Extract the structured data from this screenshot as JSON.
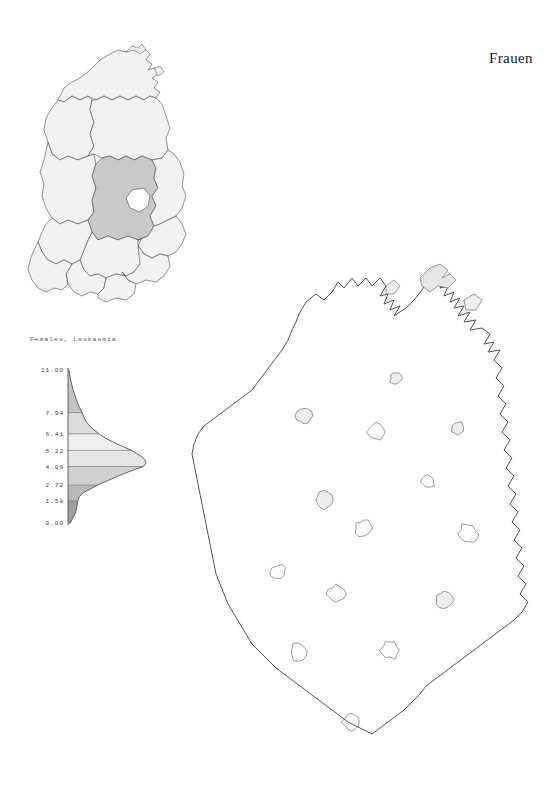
{
  "figure": {
    "title": "Frauen",
    "background_color": "#ffffff"
  },
  "inset_map": {
    "name": "gdr-bezirke-overview",
    "description": "Uebersichtskarte der Bezirke",
    "highlighted_region_shade": "#c9c9c9",
    "base_shade": "#f2f2f2",
    "outline_color": "#4a4a4a"
  },
  "legend": {
    "title": "Females, Leukaemia",
    "axis_tick_labels": [
      "11.00",
      "7.94",
      "6.41",
      "5.22",
      "4.06",
      "2.72",
      "1.58",
      "0.00"
    ],
    "axis_min": "0.00",
    "axis_max": "11.00"
  },
  "map": {
    "name": "leukaemia-rate-choropleth",
    "outline_color": "#4a4a4a"
  },
  "chart_data": {
    "type": "area",
    "title": "Females, Leukaemia",
    "xlabel": "",
    "ylabel": "",
    "ylim": [
      0.0,
      11.0
    ],
    "orientation": "horizontal-density",
    "grid": true,
    "legend_position": "none",
    "class_breaks": [
      0.0,
      1.58,
      2.72,
      4.06,
      5.22,
      6.41,
      7.94,
      11.0
    ],
    "tick_labels": [
      "0.00",
      "1.58",
      "2.72",
      "4.06",
      "5.22",
      "6.41",
      "7.94",
      "11.00"
    ],
    "class_fills": [
      "#9e9e9e",
      "#b8b8b8",
      "#d0d0d0",
      "#e6e6e6",
      "#efefef",
      "#dcdcdc",
      "#c4c4c4",
      "#a8a8a8"
    ],
    "density": {
      "y": [
        0.0,
        0.3,
        0.6,
        0.9,
        1.2,
        1.58,
        1.9,
        2.2,
        2.45,
        2.72,
        3.0,
        3.3,
        3.6,
        3.85,
        4.06,
        4.3,
        4.55,
        4.8,
        5.0,
        5.22,
        5.5,
        5.8,
        6.1,
        6.41,
        6.75,
        7.1,
        7.45,
        7.94,
        8.4,
        8.9,
        9.4,
        9.9,
        10.4,
        11.0
      ],
      "density": [
        0.03,
        0.055,
        0.085,
        0.105,
        0.115,
        0.125,
        0.145,
        0.2,
        0.29,
        0.38,
        0.49,
        0.61,
        0.74,
        0.86,
        0.965,
        1.0,
        0.985,
        0.935,
        0.88,
        0.815,
        0.7,
        0.585,
        0.48,
        0.4,
        0.32,
        0.26,
        0.215,
        0.18,
        0.14,
        0.105,
        0.075,
        0.05,
        0.03,
        0.012
      ]
    }
  }
}
